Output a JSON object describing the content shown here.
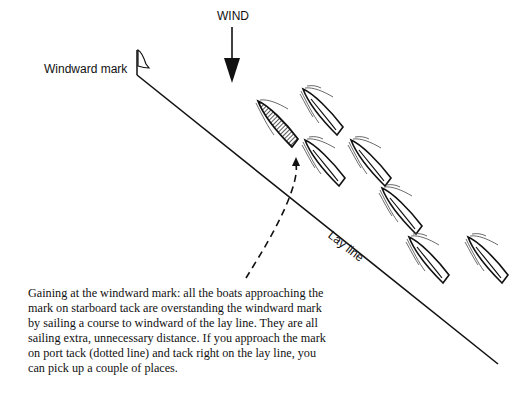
{
  "labels": {
    "wind": "WIND",
    "windward_mark": "Windward mark",
    "lay_line": "Lay line"
  },
  "caption": "Gaining at the windward mark: all the boats approaching the mark on starboard tack are overstanding the windward mark by sailing a course to windward of the lay line. They are all sailing extra, unnecessary distance. If you approach the mark on port tack (dotted line) and tack right on the lay line, you can pick up a couple of places.",
  "colors": {
    "ink": "#111111",
    "background": "#ffffff"
  },
  "elements": {
    "boats_starboard_tack_count": 7,
    "highlighted_boat": "hatched boat on port-tack approach",
    "dotted_line": "port tack course (dashed)"
  }
}
